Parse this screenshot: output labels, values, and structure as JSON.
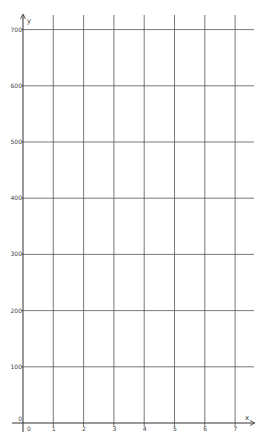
{
  "chart_data": {
    "type": "line",
    "title": "",
    "xlabel": "x",
    "ylabel": "y",
    "xlim": [
      0,
      7
    ],
    "ylim": [
      0,
      700
    ],
    "x_ticks": [
      "0",
      "1",
      "2",
      "3",
      "4",
      "5",
      "6",
      "7"
    ],
    "y_ticks": [
      "0",
      "100",
      "200",
      "300",
      "400",
      "500",
      "600",
      "700"
    ],
    "grid": true,
    "series": [],
    "legend": null
  },
  "colors": {
    "grid": "#555555",
    "axis": "#333333",
    "background": "#ffffff"
  }
}
